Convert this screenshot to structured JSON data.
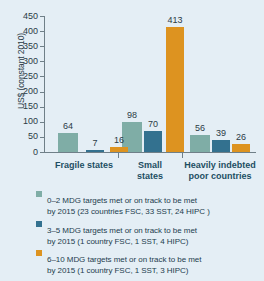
{
  "chart_data": {
    "type": "bar",
    "title": "",
    "xlabel": "",
    "ylabel": "US$ (constant 2010)",
    "ylim": [
      0,
      450
    ],
    "yticks": [
      450,
      400,
      350,
      300,
      250,
      200,
      150,
      100,
      50,
      0
    ],
    "grid": false,
    "legend_position": "bottom",
    "categories": [
      "Fragile states",
      "Small states",
      "Heavily indebted poor countries"
    ],
    "category_lines": [
      [
        "Fragile states"
      ],
      [
        "Small",
        "states"
      ],
      [
        "Heavily indebted",
        "poor countries"
      ]
    ],
    "series": [
      {
        "name": "0–2 MDG targets met or on track to be met by 2015 (23 countries FSC, 33 SST, 24 HIPC )",
        "color": "#7fada6",
        "values": [
          64,
          98,
          56
        ]
      },
      {
        "name": "3–5 MDG targets met or on track to be met by 2015 (1 country FSC, 1 SST, 4 HIPC)",
        "color": "#33718f",
        "values": [
          7,
          70,
          39
        ]
      },
      {
        "name": "6–10 MDG targets met or on track to be met by 2015 (1 country FSC, 1 SST, 3 HIPC)",
        "color": "#dd9320",
        "values": [
          16,
          413,
          26
        ]
      }
    ]
  },
  "axis": {
    "y_title": "US$ (constant 2010)",
    "y_ticks": [
      "450",
      "400",
      "350",
      "300",
      "250",
      "200",
      "150",
      "100",
      "50",
      "0"
    ]
  },
  "bar_labels": {
    "g0": [
      "64",
      "7",
      "16"
    ],
    "g1": [
      "98",
      "70",
      "413"
    ],
    "g2": [
      "56",
      "39",
      "26"
    ]
  },
  "categories": {
    "c0_l1": "Fragile states",
    "c1_l1": "Small",
    "c1_l2": "states",
    "c2_l1": "Heavily indebted",
    "c2_l2": "poor countries"
  },
  "legend": {
    "items": [
      {
        "color": "#7fada6",
        "line1": "0–2 MDG targets met or on track to be met",
        "line2": "by 2015 (23 countries FSC, 33 SST, 24 HIPC )"
      },
      {
        "color": "#33718f",
        "line1": "3–5 MDG targets met or on track to be met",
        "line2": "by 2015 (1 country FSC, 1 SST, 4 HIPC)"
      },
      {
        "color": "#dd9320",
        "line1": "6–10 MDG targets met or on track to be met",
        "line2": "by 2015 (1 country FSC, 1 SST, 3 HIPC)"
      }
    ]
  },
  "colors": {
    "background": "#e4eef5",
    "series_1": "#7fada6",
    "series_2": "#33718f",
    "series_3": "#dd9320",
    "axis": "#6f7f88",
    "text": "#2b3b45",
    "category_text": "#1d4e63"
  }
}
